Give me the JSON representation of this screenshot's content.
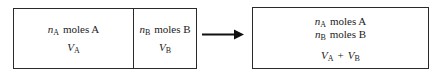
{
  "colors": {
    "background": "#ffffff",
    "border": "#2a2a2a",
    "text": "#1c1c1c",
    "arrow": "#111111"
  },
  "initial_state": {
    "compartment_a": {
      "moles": {
        "symbol": "n",
        "subscript": "A",
        "label": "moles A"
      },
      "volume": {
        "symbol": "V",
        "subscript": "A"
      }
    },
    "compartment_b": {
      "moles": {
        "symbol": "n",
        "subscript": "B",
        "label": "moles B"
      },
      "volume": {
        "symbol": "V",
        "subscript": "B"
      }
    }
  },
  "arrow": {
    "icon": "arrow-right"
  },
  "final_state": {
    "moles_a": {
      "symbol": "n",
      "subscript": "A",
      "label": "moles A"
    },
    "moles_b": {
      "symbol": "n",
      "subscript": "B",
      "label": "moles B"
    },
    "volume": {
      "symbol1": "V",
      "subscript1": "A",
      "operator": "+",
      "symbol2": "V",
      "subscript2": "B"
    }
  }
}
